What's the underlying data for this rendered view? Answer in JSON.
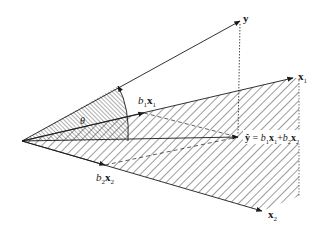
{
  "diagram": {
    "labels": {
      "y": "y",
      "x1_base": "x",
      "x1_sub": "1",
      "x2_base": "x",
      "x2_sub": "2",
      "theta": "θ",
      "b1x1_coef": "b",
      "b1x1_coef_sub": "1",
      "b1x1_vec": "x",
      "b1x1_vec_sub": "1",
      "b2x2_coef": "b",
      "b2x2_coef_sub": "2",
      "b2x2_vec": "x",
      "b2x2_vec_sub": "2",
      "yhat": "ŷ",
      "equals": " = ",
      "plus": "+",
      "eq_b1": "b",
      "eq_b1_sub": "1",
      "eq_x1": "x",
      "eq_x1_sub": "1",
      "eq_b2": "b",
      "eq_b2_sub": "2",
      "eq_x2": "x",
      "eq_x2_sub": "2"
    },
    "colors": {
      "stroke": "#1a1a1a",
      "hatch": "#3a3a3a",
      "background": "#ffffff"
    },
    "points": {
      "origin": [
        22,
        141
      ],
      "y": [
        240,
        21
      ],
      "x1": [
        293,
        78
      ],
      "x2": [
        262,
        211
      ],
      "yhat": [
        238,
        137
      ],
      "b1x1": [
        144,
        111
      ],
      "b2x2": [
        105,
        166
      ]
    }
  }
}
